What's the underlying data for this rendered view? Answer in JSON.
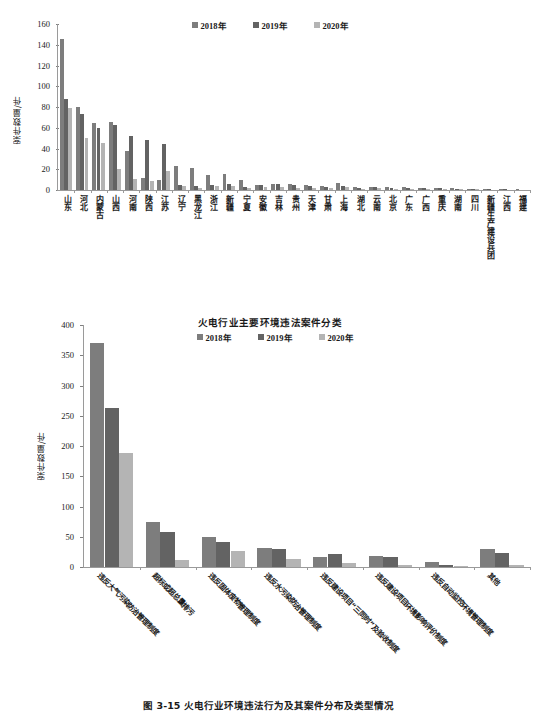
{
  "colors": {
    "series2018": "#7d7d7d",
    "series2019": "#636363",
    "series2020": "#b4b4b4",
    "axis": "#9a9a9a",
    "text": "#1a1a1a"
  },
  "caption": {
    "text": "图 3-15   火电行业环境违法行为及其案件分布及类型情况"
  },
  "chart_data": [
    {
      "id": "chart1",
      "type": "bar",
      "title": "",
      "xlabel": "",
      "ylabel": "案件数量/件",
      "ylim": [
        0,
        160
      ],
      "yticks": [
        0,
        20,
        40,
        60,
        80,
        100,
        120,
        140,
        160
      ],
      "grid": false,
      "legend_position": "top-center",
      "legend": [
        "2018年",
        "2019年",
        "2020年"
      ],
      "categories": [
        "山东",
        "河北",
        "内蒙古",
        "山西",
        "河南",
        "陕西",
        "江苏",
        "辽宁",
        "黑龙江",
        "浙江",
        "新疆",
        "宁夏",
        "安徽",
        "吉林",
        "贵州",
        "天津",
        "甘肃",
        "上海",
        "湖北",
        "云南",
        "北京",
        "广东",
        "广西",
        "重庆",
        "湖南",
        "四川",
        "新疆生产建设兵团",
        "江西",
        "福建"
      ],
      "series": [
        {
          "name": "2018年",
          "values": [
            146,
            80,
            65,
            66,
            38,
            12,
            10,
            23,
            21,
            14,
            15,
            10,
            5,
            6,
            6,
            5,
            4,
            7,
            3,
            3,
            3,
            3,
            2,
            2,
            2,
            1,
            1,
            1,
            1
          ]
        },
        {
          "name": "2019年",
          "values": [
            88,
            73,
            60,
            63,
            52,
            48,
            44,
            5,
            4,
            5,
            6,
            3,
            5,
            6,
            5,
            4,
            3,
            4,
            2,
            3,
            2,
            2,
            2,
            2,
            1,
            1,
            1,
            1,
            0
          ]
        },
        {
          "name": "2020年",
          "values": [
            79,
            50,
            45,
            20,
            11,
            9,
            18,
            4,
            2,
            4,
            4,
            2,
            3,
            3,
            2,
            2,
            2,
            3,
            1,
            2,
            1,
            1,
            1,
            1,
            1,
            1,
            0,
            0,
            0
          ]
        }
      ]
    },
    {
      "id": "chart2",
      "type": "bar",
      "title": "火电行业主要环境违法案件分类",
      "xlabel": "",
      "ylabel": "案件数量/件",
      "ylim": [
        0,
        400
      ],
      "yticks": [
        0,
        50,
        100,
        150,
        200,
        250,
        300,
        350,
        400
      ],
      "grid": false,
      "legend_position": "top-center",
      "legend": [
        "2018年",
        "2019年",
        "2020年"
      ],
      "categories": [
        "违反大气污染防治管理制度",
        "超标或超总量排污",
        "违反固体废物管理制度",
        "违反水污染防治管理制度",
        "违反建设项目“三同时”及验收制度",
        "违反建设项目环境影响评价制度",
        "违反自动监控环境管理制度",
        "其他"
      ],
      "series": [
        {
          "name": "2018年",
          "values": [
            371,
            74,
            50,
            31,
            17,
            19,
            9,
            30
          ]
        },
        {
          "name": "2019年",
          "values": [
            263,
            58,
            41,
            29,
            21,
            16,
            3,
            23
          ]
        },
        {
          "name": "2020年",
          "values": [
            188,
            11,
            27,
            14,
            7,
            4,
            1,
            4
          ]
        }
      ]
    }
  ]
}
